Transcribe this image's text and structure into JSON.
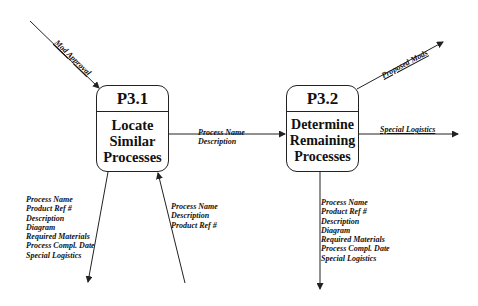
{
  "processes": [
    {
      "id": "P3.1",
      "name_lines": [
        "Locate",
        "Similar",
        "Processes"
      ]
    },
    {
      "id": "P3.2",
      "name_lines": [
        "Determine",
        "Remaining",
        "Processes"
      ]
    }
  ],
  "flows": {
    "mod_approval": {
      "label": "Mod Approval"
    },
    "p31_to_p32": {
      "lines": [
        "Process Name",
        "Description"
      ]
    },
    "proposed_mods": {
      "label": "Proposed Mods"
    },
    "special_logistics": {
      "label": "Special Logistics"
    },
    "p31_out_down": {
      "lines": [
        "Process Name",
        "Product Ref #",
        "Description",
        "Diagram",
        "Required Materials",
        "Process Compl. Date",
        "Special Logistics"
      ]
    },
    "p31_in_up": {
      "lines": [
        "Process Name",
        "Description",
        "Product Ref #"
      ]
    },
    "p32_out_down": {
      "lines": [
        "Process Name",
        "Product Ref #",
        "Description",
        "Diagram",
        "Required Materials",
        "Process Compl. Date",
        "Special Logistics"
      ]
    }
  },
  "colors": {
    "line": "#222222",
    "background": "#ffffff"
  }
}
